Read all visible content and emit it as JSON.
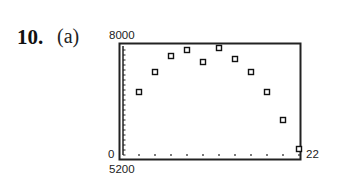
{
  "problem": {
    "number": "10.",
    "part": "(a)"
  },
  "window_labels": {
    "ymax": "8000",
    "xmin": "0",
    "ymin": "5200",
    "xmax": "22"
  },
  "chart_data": {
    "type": "scatter",
    "title": "",
    "xlabel": "",
    "ylabel": "",
    "xlim": [
      0,
      22
    ],
    "ylim": [
      5200,
      8000
    ],
    "x_tick_step": 2,
    "grid": false,
    "legend": null,
    "marker": "hollow-square",
    "series": [
      {
        "name": "data",
        "x": [
          2,
          4,
          6,
          8,
          10,
          12,
          14,
          16,
          18,
          20,
          22
        ],
        "y": [
          6775,
          7275,
          7675,
          7825,
          7525,
          7875,
          7600,
          7275,
          6775,
          6075,
          5350
        ]
      }
    ]
  }
}
